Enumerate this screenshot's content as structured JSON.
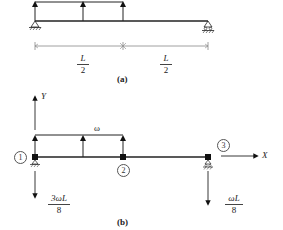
{
  "diagram": {
    "part_a": {
      "caption": "(a)",
      "span_labels": [
        {
          "num": "L",
          "den": "2"
        },
        {
          "num": "L",
          "den": "2"
        }
      ],
      "supports": [
        "pin",
        "roller"
      ],
      "load": "uniform distributed load over left half (upward arrows)"
    },
    "part_b": {
      "caption": "(b)",
      "axis_y_label": "Y",
      "axis_x_label": "X",
      "load_label": "ω",
      "nodes": [
        "1",
        "2",
        "3"
      ],
      "reactions": [
        {
          "num": "3ωL",
          "den": "8"
        },
        {
          "num": "ωL",
          "den": "8"
        }
      ]
    },
    "colors": {
      "line": "#222222",
      "dimension": "#888888",
      "background": "#ffffff"
    }
  }
}
